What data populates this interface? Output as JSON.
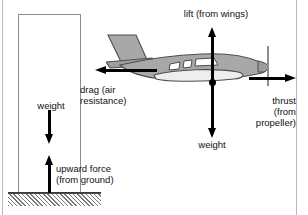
{
  "diagram": {
    "type": "force-diagram",
    "background_color": "#ffffff",
    "frame_color": "#b9b9b9",
    "arrow_color": "#000000",
    "plane_fill_color": "#a8a8a8",
    "plane_outline_color": "#4d4d4d",
    "ground_hatch_color": "#7a7a7a"
  },
  "left_scene": {
    "name": "pillar-on-ground",
    "pillar": {
      "fill": "#ffffff",
      "stroke": "#8d8d8d"
    },
    "ground": {
      "pattern": "diagonal-hatch",
      "color": "#7a7a7a"
    },
    "forces": [
      {
        "id": "weight",
        "label": "weight",
        "direction": "down"
      },
      {
        "id": "upward-force",
        "label": "upward force\n(from ground)",
        "direction": "up"
      }
    ]
  },
  "right_scene": {
    "name": "aeroplane-in-flight",
    "forces": [
      {
        "id": "lift",
        "label": "lift (from wings)",
        "direction": "up"
      },
      {
        "id": "weight",
        "label": "weight",
        "direction": "down"
      },
      {
        "id": "drag",
        "label": "drag (air\nresistance)",
        "direction": "left"
      },
      {
        "id": "thrust",
        "label": "thrust\n(from\npropeller)",
        "direction": "right"
      }
    ]
  },
  "labels": {
    "weight_left": "weight",
    "upward_force": "upward force\n(from ground)",
    "lift": "lift (from wings)",
    "drag": "drag (air\nresistance)",
    "weight_plane": "weight",
    "thrust": "thrust\n(from\npropeller)"
  }
}
